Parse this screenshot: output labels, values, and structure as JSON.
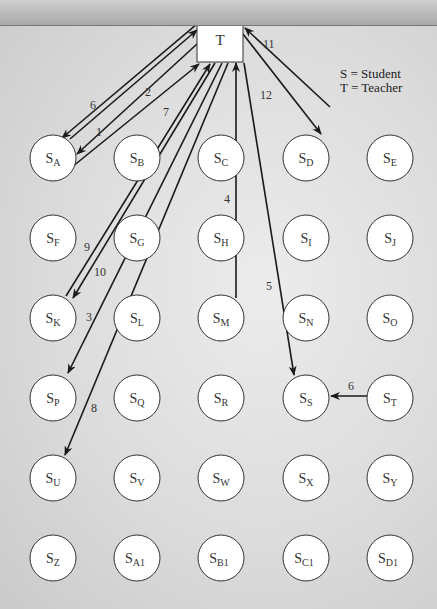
{
  "teacher": {
    "id": "T",
    "label": "T"
  },
  "legend": [
    {
      "text": "S = Student"
    },
    {
      "text": "T = Teacher"
    }
  ],
  "students": [
    [
      "A",
      "B",
      "C",
      "D",
      "E"
    ],
    [
      "F",
      "G",
      "H",
      "I",
      "J"
    ],
    [
      "K",
      "L",
      "M",
      "N",
      "O"
    ],
    [
      "P",
      "Q",
      "R",
      "S",
      "T"
    ],
    [
      "U",
      "V",
      "W",
      "X",
      "Y"
    ],
    [
      "Z",
      "A1",
      "B1",
      "C1",
      "D1"
    ]
  ],
  "student_prefix": "S",
  "interactions": [
    {
      "order": "1",
      "from": "T",
      "to": "A"
    },
    {
      "order": "2",
      "from": "A",
      "to": "T"
    },
    {
      "order": "3",
      "from": "T",
      "to": "P"
    },
    {
      "order": "4",
      "from": "M",
      "to": "T"
    },
    {
      "order": "5",
      "from": "T",
      "to": "S"
    },
    {
      "order": "6",
      "from": "T",
      "to": "A"
    },
    {
      "order": "6",
      "from": "ST",
      "to": "S"
    },
    {
      "order": "7",
      "from": "A",
      "to": "T"
    },
    {
      "order": "8",
      "from": "T",
      "to": "U"
    },
    {
      "order": "9",
      "from": "K",
      "to": "T"
    },
    {
      "order": "10",
      "from": "T",
      "to": "K"
    },
    {
      "order": "11",
      "from": "D",
      "to": "T"
    },
    {
      "order": "12",
      "from": "T",
      "to": "D"
    }
  ]
}
